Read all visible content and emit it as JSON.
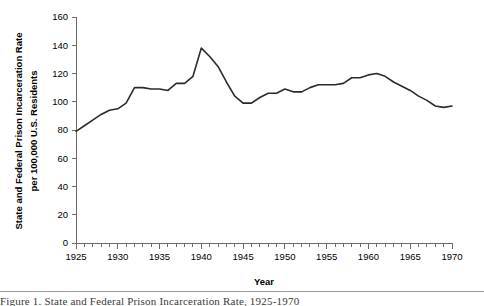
{
  "chart_data": {
    "type": "line",
    "title": "",
    "xlabel": "Year",
    "ylabel": "State and Federal Prison Incarceration Rate per 100,000 U.S. Residents",
    "ylabel_line1": "State and Federal Prison Incarceration Rate",
    "ylabel_line2": "per 100,000 U.S. Residents",
    "xlim": [
      1925,
      1970
    ],
    "ylim": [
      0,
      160
    ],
    "grid": false,
    "legend": null,
    "y_ticks": [
      0,
      20,
      40,
      60,
      80,
      100,
      120,
      140,
      160
    ],
    "y_tick_labels": [
      "0",
      "20",
      "40",
      "60",
      "80",
      "100",
      "120",
      "140",
      "160"
    ],
    "x_ticks_major": [
      1925,
      1930,
      1935,
      1940,
      1945,
      1950,
      1955,
      1960,
      1965,
      1970
    ],
    "x_tick_labels": [
      "1925",
      "1930",
      "1935",
      "1940",
      "1945",
      "1950",
      "1955",
      "1960",
      "1965",
      "1970"
    ],
    "x_minor_tick_step": 1,
    "line_color": "#2b2b2b",
    "axis_color": "#6b6b6b",
    "x": [
      1925,
      1926,
      1927,
      1928,
      1929,
      1930,
      1931,
      1932,
      1933,
      1934,
      1935,
      1936,
      1937,
      1938,
      1939,
      1940,
      1941,
      1942,
      1943,
      1944,
      1945,
      1946,
      1947,
      1948,
      1949,
      1950,
      1951,
      1952,
      1953,
      1954,
      1955,
      1956,
      1957,
      1958,
      1959,
      1960,
      1961,
      1962,
      1963,
      1964,
      1965,
      1966,
      1967,
      1968,
      1969,
      1970
    ],
    "values": [
      79,
      83,
      87,
      91,
      94,
      95,
      99,
      110,
      110,
      109,
      109,
      108,
      113,
      113,
      118,
      138,
      132,
      125,
      114,
      104,
      99,
      99,
      103,
      106,
      106,
      109,
      107,
      107,
      110,
      112,
      112,
      112,
      113,
      117,
      117,
      119,
      120,
      118,
      114,
      111,
      108,
      104,
      101,
      97,
      96,
      97
    ]
  },
  "figure": {
    "caption": "Figure 1.  State and Federal Prison Incarceration Rate, 1925-1970"
  }
}
